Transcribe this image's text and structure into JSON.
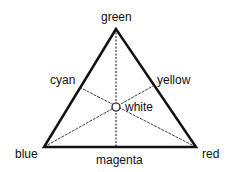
{
  "diagram": {
    "labels": {
      "top": "green",
      "left_mid": "cyan",
      "right_mid": "yellow",
      "center": "white",
      "bottom_left": "blue",
      "bottom_mid": "magenta",
      "bottom_right": "red"
    },
    "colors": {
      "stroke": "#111111",
      "background": "#ffffff"
    }
  }
}
